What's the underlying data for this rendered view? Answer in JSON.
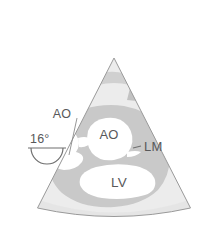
{
  "figure": {
    "background_color": "#ffffff"
  },
  "transducer": {
    "angle_label": "16°",
    "icon_name": "transducer-icon"
  },
  "sector": {
    "name": "ultrasound-sector",
    "fill_color": "#ededed",
    "outline_color": "#8c8c8c",
    "apex_x": 114,
    "apex_y": 58,
    "left_edge_x": 38,
    "right_edge_x": 190,
    "bottom_y": 209
  },
  "tissue": {
    "myocardium_color": "#c9c9c9",
    "chamber_color": "#ffffff",
    "near_field_band_color": "#cfcfcf",
    "speckle_color": "#c2c2c2"
  },
  "labels": [
    {
      "id": "ao-outflow",
      "text": "AO",
      "x": 62,
      "y": 114,
      "leader": true,
      "leader_from": [
        76,
        117
      ],
      "leader_to": [
        72,
        148
      ]
    },
    {
      "id": "ao-root",
      "text": "AO",
      "x": 98,
      "y": 139,
      "leader": false
    },
    {
      "id": "lm",
      "text": "LM",
      "x": 142,
      "y": 150,
      "leader": true,
      "leader_from": [
        140,
        146
      ],
      "leader_to": [
        131,
        148
      ]
    },
    {
      "id": "lv",
      "text": "LV",
      "x": 110,
      "y": 183,
      "leader": false
    }
  ],
  "legend": {
    "ao_meaning": "AO",
    "lm_meaning": "LM",
    "lv_meaning": "LV"
  }
}
